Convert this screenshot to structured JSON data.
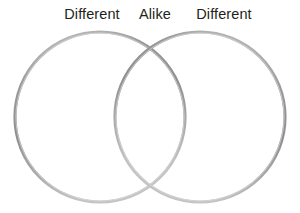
{
  "figure": {
    "type": "venn-diagram",
    "background_color": "#ffffff",
    "width": 300,
    "height": 213
  },
  "labels": {
    "left": "Different",
    "center": "Alike",
    "right": "Different",
    "text_color": "#231f20"
  },
  "circles": {
    "stroke_color_dark": "#8e8e8e",
    "stroke_color_light": "#c9c9c9",
    "fill": "none",
    "stroke_width": 3,
    "left": {
      "cx": 100,
      "cy": 117,
      "r": 85
    },
    "right": {
      "cx": 200,
      "cy": 117,
      "r": 85
    }
  },
  "chart_data": {
    "type": "venn",
    "title": "",
    "sets": [
      {
        "name": "Different",
        "position": "left",
        "label": "Different"
      },
      {
        "name": "Different",
        "position": "right",
        "label": "Different"
      }
    ],
    "intersection": {
      "label": "Alike",
      "position": "center"
    },
    "set_count": 2,
    "legend": "none",
    "grid": false
  }
}
